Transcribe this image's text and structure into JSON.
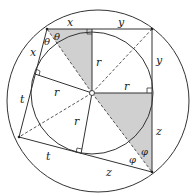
{
  "diagram": {
    "colors": {
      "stroke": "#333333",
      "shade": "#d0d0d0",
      "background": "#ffffff"
    },
    "outer_circle": {
      "cx": 98,
      "cy": 101,
      "r": 91
    },
    "inner_circle": {
      "cx": 92,
      "cy": 93,
      "r": 61
    },
    "center": {
      "x": 92,
      "y": 93
    },
    "vertices": {
      "A": {
        "x": 47,
        "y": 29
      },
      "B": {
        "x": 152,
        "y": 29
      },
      "C": {
        "x": 152,
        "y": 172
      },
      "D": {
        "x": 19,
        "y": 137
      }
    },
    "tangent_points": {
      "top": {
        "x": 92,
        "y": 29
      },
      "right": {
        "x": 152,
        "y": 93
      },
      "bottom": {
        "x": 81,
        "y": 154
      },
      "left": {
        "x": 35,
        "y": 74
      }
    },
    "labels": {
      "x_top": "x",
      "y_top": "y",
      "x_left": "x",
      "theta_1": "θ",
      "theta_2": "θ",
      "y_right": "y",
      "r_top": "r",
      "r_right": "r",
      "r_left": "r",
      "r_bottom": "r",
      "t_left": "t",
      "t_bottom": "t",
      "z_right": "z",
      "z_bottom": "z",
      "phi_1": "φ",
      "phi_2": "φ"
    }
  }
}
